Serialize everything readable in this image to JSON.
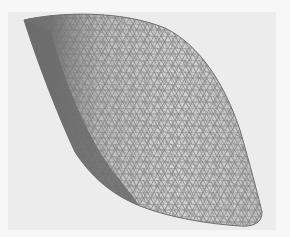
{
  "figure": {
    "background_color": "#ececec",
    "frame_color": "#f7f7f7",
    "mesh_color": "#6e6e6e",
    "edge_shade_color": "#7a7a7a"
  }
}
